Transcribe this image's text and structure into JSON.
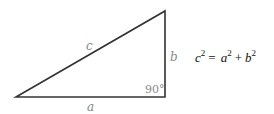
{
  "diagram": {
    "type": "right-triangle",
    "vertices": {
      "bottom_left": [
        16,
        97
      ],
      "right_angle": [
        165,
        97
      ],
      "top": [
        165,
        11
      ]
    },
    "stroke_color": "#333333",
    "label_color": "#888888",
    "labels": {
      "hypotenuse": "c",
      "vertical_leg": "b",
      "horizontal_leg": "a",
      "right_angle": "90°"
    },
    "equation": {
      "lhs_base": "c",
      "lhs_exp": "2",
      "equals": "=",
      "term1_base": "a",
      "term1_exp": "2",
      "plus": "+",
      "term2_base": "b",
      "term2_exp": "2"
    }
  }
}
